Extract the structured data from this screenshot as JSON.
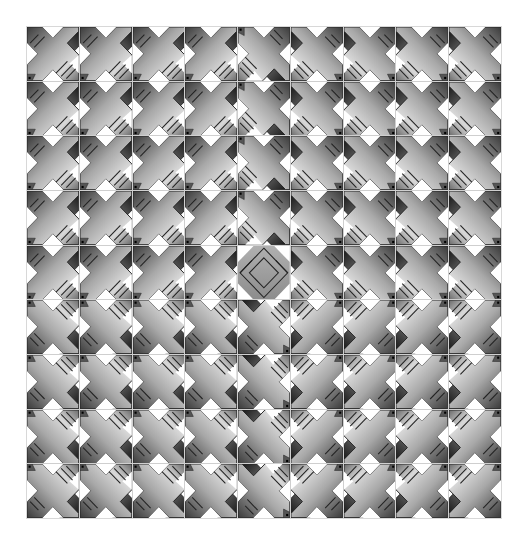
{
  "pattern": {
    "rows": 9,
    "cols": 9,
    "tile_names": {
      "cross": "x-cross-tile",
      "diamond": "diamond-tile"
    },
    "orientations_legend": {
      "A": "top-left quadrant orientation",
      "B": "top-right quadrant orientation (mirror-x)",
      "C": "bottom-left quadrant orientation (mirror-y)",
      "D": "bottom-right quadrant orientation (rotate-180)",
      "H": "middle row left (dark-top variant)",
      "K": "middle row right (mirror-x dark variant)",
      "V": "middle column top (vertical split)",
      "W": "middle column bottom (vertical split flipped)",
      "Z": "center diamond"
    },
    "layout": [
      [
        "A",
        "A",
        "A",
        "A",
        "V",
        "B",
        "B",
        "B",
        "B"
      ],
      [
        "A",
        "A",
        "A",
        "A",
        "V",
        "B",
        "B",
        "B",
        "B"
      ],
      [
        "A",
        "A",
        "A",
        "A",
        "V",
        "B",
        "B",
        "B",
        "B"
      ],
      [
        "A",
        "A",
        "A",
        "A",
        "V",
        "B",
        "B",
        "B",
        "B"
      ],
      [
        "H",
        "H",
        "H",
        "H",
        "Z",
        "K",
        "K",
        "K",
        "K"
      ],
      [
        "C",
        "C",
        "C",
        "C",
        "W",
        "D",
        "D",
        "D",
        "D"
      ],
      [
        "C",
        "C",
        "C",
        "C",
        "W",
        "D",
        "D",
        "D",
        "D"
      ],
      [
        "C",
        "C",
        "C",
        "C",
        "W",
        "D",
        "D",
        "D",
        "D"
      ],
      [
        "C",
        "C",
        "C",
        "C",
        "W",
        "D",
        "D",
        "D",
        "D"
      ]
    ]
  },
  "colors": {
    "light": "#f2f2f2",
    "mid": "#9a9a9a",
    "dark": "#1e1e1e",
    "outline": "#222222",
    "background": "#ffffff",
    "gridline": "#cfcfcf"
  }
}
